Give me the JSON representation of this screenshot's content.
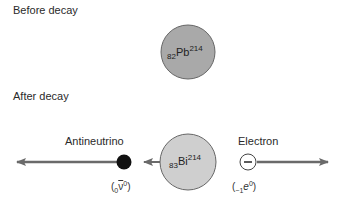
{
  "sections": {
    "before": {
      "title": "Before decay"
    },
    "after": {
      "title": "After decay"
    }
  },
  "parent_nucleus": {
    "atomic_number": "82",
    "symbol": "Pb",
    "mass_number": "214",
    "fill": "#a9a9a9"
  },
  "daughter_nucleus": {
    "atomic_number": "83",
    "symbol": "Bi",
    "mass_number": "214",
    "fill": "#cfcfcf"
  },
  "antineutrino": {
    "label": "Antineutrino",
    "formula": {
      "open": "(",
      "sub": "0",
      "symbol": "ν",
      "sup": "0",
      "close": ")"
    },
    "fill": "#111111"
  },
  "electron": {
    "label": "Electron",
    "sign": "−",
    "formula": {
      "open": "(",
      "sub": "−1",
      "symbol": "e",
      "sup": "0",
      "close": ")"
    },
    "fill": "#ffffff"
  },
  "colors": {
    "arrow": "#6a6a6a",
    "outline": "#555555"
  }
}
